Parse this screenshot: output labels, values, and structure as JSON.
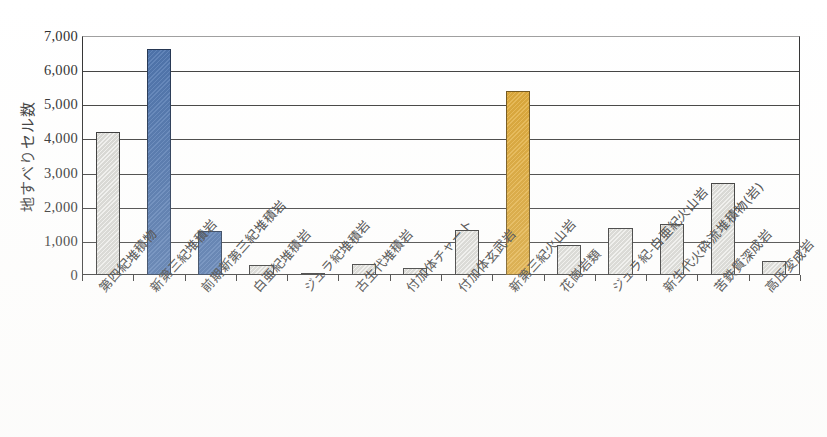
{
  "chart_data": {
    "type": "bar",
    "title": "",
    "xlabel": "",
    "ylabel": "地すべりセル数",
    "ylim": [
      0,
      7000
    ],
    "ytick_step": 1000,
    "grid": true,
    "legend": "none",
    "categories": [
      "第四紀堆積物",
      "新第三紀堆積岩",
      "前期新第三紀堆積岩",
      "白亜紀堆積岩",
      "ジュラ紀堆積岩",
      "古生代堆積岩",
      "付加体チャート",
      "付加体玄武岩",
      "新第三紀火山岩",
      "花崗岩類",
      "ジュラ紀-白亜紀火山岩",
      "新生代火砕流堆積物(岩)",
      "苦鉄質深成岩",
      "高圧変成岩"
    ],
    "values": [
      4200,
      6630,
      1300,
      280,
      60,
      330,
      200,
      1330,
      5400,
      870,
      1380,
      1500,
      2700,
      400
    ],
    "bar_colors": [
      "gray",
      "blue",
      "blue",
      "gray",
      "gray",
      "gray",
      "gray",
      "gray",
      "orange",
      "gray",
      "gray",
      "gray",
      "gray",
      "gray"
    ],
    "ytick_labels": [
      "7,000",
      "6,000",
      "5,000",
      "4,000",
      "3,000",
      "2,000",
      "1,000",
      "0"
    ],
    "ytick_values": [
      7000,
      6000,
      5000,
      4000,
      3000,
      2000,
      1000,
      0
    ],
    "colors": {
      "gray_bar": "#dcdcd8",
      "blue_bar": "#4a72ae",
      "orange_bar": "#e0a82e",
      "axis": "#2e2e2e",
      "gridline": "#3a3a3a",
      "background": "#ffffff"
    }
  }
}
